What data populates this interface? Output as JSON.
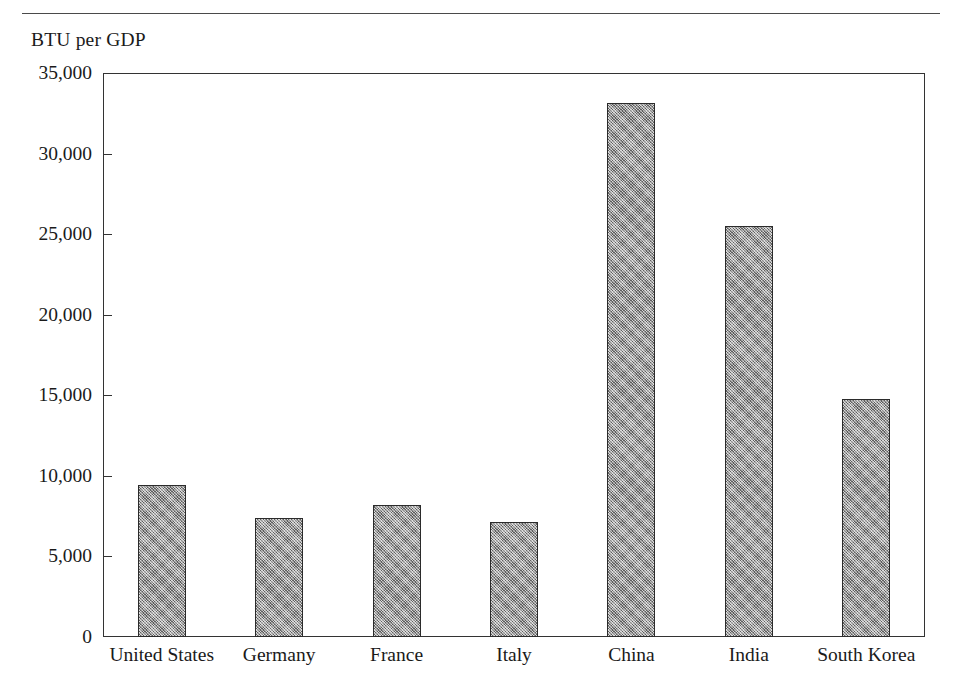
{
  "chart_data": {
    "type": "bar",
    "title": "",
    "ylabel": "BTU per GDP",
    "xlabel": "",
    "categories": [
      "United States",
      "Germany",
      "France",
      "Italy",
      "China",
      "India",
      "South Korea"
    ],
    "values": [
      9450,
      7400,
      8200,
      7150,
      33150,
      25500,
      14800
    ],
    "ylim": [
      0,
      35000
    ],
    "yticks": [
      0,
      5000,
      10000,
      15000,
      20000,
      25000,
      30000,
      35000
    ],
    "ytick_labels": [
      "0",
      "5,000",
      "10,000",
      "15,000",
      "20,000",
      "25,000",
      "30,000",
      "35,000"
    ],
    "grid": false,
    "legend": null,
    "bar_fill_color": "#8f8f8f",
    "bar_edge_color": "#2b2b2b",
    "axis_color": "#333333",
    "rule_color": "#4a4a4a"
  }
}
